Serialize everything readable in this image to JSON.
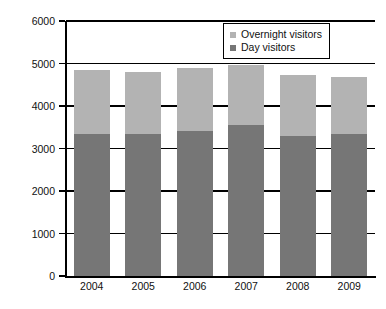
{
  "chart_data": {
    "type": "bar",
    "subtype": "stacked-vertical",
    "title": "",
    "subtitle": "",
    "xlabel": "",
    "ylabel": "",
    "categories": [
      "2004",
      "2005",
      "2006",
      "2007",
      "2008",
      "2009"
    ],
    "series": [
      {
        "name": "Day visitors",
        "color": "#767676",
        "values": [
          3350,
          3340,
          3410,
          3550,
          3300,
          3350
        ]
      },
      {
        "name": "Overnight visitors",
        "color": "#b3b3b3",
        "values": [
          1490,
          1470,
          1490,
          1420,
          1420,
          1340
        ]
      }
    ],
    "stack_order_bottom_to_top": [
      "Day visitors",
      "Overnight visitors"
    ],
    "totals": [
      4840,
      4810,
      4900,
      4970,
      4720,
      4690
    ],
    "ylim": [
      0,
      6000
    ],
    "yticks": [
      0,
      1000,
      2000,
      3000,
      4000,
      5000,
      6000
    ],
    "ytick_labels": [
      "0",
      "1000",
      "2000",
      "3000",
      "4000",
      "5000",
      "6000"
    ],
    "grid": true,
    "grid_axis": "y",
    "legend_position": "top-right",
    "legend_entries": [
      {
        "label": "Overnight visitors",
        "color": "#b3b3b3"
      },
      {
        "label": "Day visitors",
        "color": "#767676"
      }
    ],
    "annotations": []
  },
  "axes": {
    "y_ticks": [
      {
        "label": "6000",
        "value": 6000
      },
      {
        "label": "5000",
        "value": 5000
      },
      {
        "label": "4000",
        "value": 4000
      },
      {
        "label": "3000",
        "value": 3000
      },
      {
        "label": "2000",
        "value": 2000
      },
      {
        "label": "1000",
        "value": 1000
      },
      {
        "label": "0",
        "value": 0
      }
    ],
    "x_ticks": [
      {
        "label": "2004"
      },
      {
        "label": "2005"
      },
      {
        "label": "2006"
      },
      {
        "label": "2007"
      },
      {
        "label": "2008"
      },
      {
        "label": "2009"
      }
    ]
  },
  "legend": {
    "items": [
      {
        "label": "Overnight visitors",
        "color": "#b3b3b3",
        "swatch_name": "overnight-swatch"
      },
      {
        "label": "Day visitors",
        "color": "#767676",
        "swatch_name": "day-swatch"
      }
    ]
  },
  "colors": {
    "overnight": "#b3b3b3",
    "day": "#767676",
    "axis": "#000000",
    "background": "#ffffff",
    "text": "#111111"
  }
}
